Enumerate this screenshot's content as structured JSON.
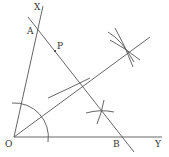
{
  "diagram": {
    "labels": {
      "X": "X",
      "A": "A",
      "P": "P",
      "O": "O",
      "B": "B",
      "Y": "Y"
    },
    "stroke_color": "#555555",
    "background": "#ffffff"
  }
}
